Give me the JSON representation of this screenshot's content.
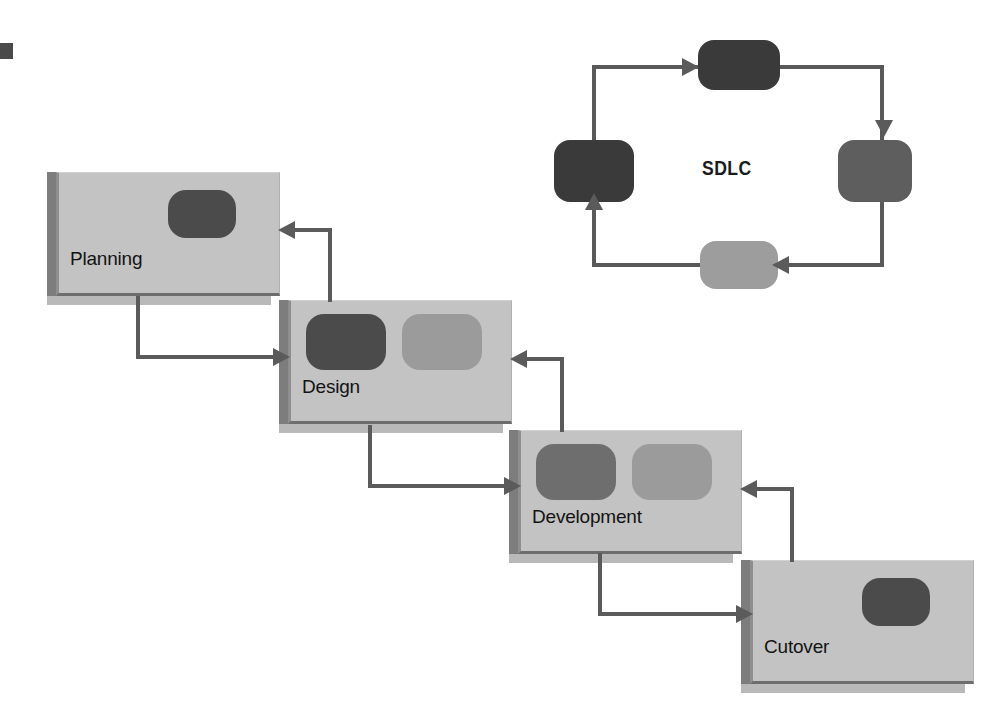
{
  "diagram": {
    "colors": {
      "box_face": "#c3c3c3",
      "box_bevel": "#7d7d7d",
      "box_shadow": "#b9b9b9",
      "connector": "#5b5b5b",
      "pill_dark": "#4b4b4b",
      "pill_mid": "#6e6e6e",
      "pill_light": "#9b9b9b",
      "text": "#131313",
      "background": "#ffffff"
    }
  },
  "waterfall": {
    "stages": [
      {
        "id": "planning",
        "label": "Planning",
        "x": 56,
        "y": 172,
        "pills": [
          {
            "tone": "dark",
            "x": 112,
            "y": 18,
            "w": 68,
            "h": 48
          }
        ]
      },
      {
        "id": "design",
        "label": "Design",
        "x": 288,
        "y": 300,
        "pills": [
          {
            "tone": "dark",
            "x": 18,
            "y": 14,
            "w": 80,
            "h": 56
          },
          {
            "tone": "light",
            "x": 114,
            "y": 14,
            "w": 80,
            "h": 56
          }
        ]
      },
      {
        "id": "development",
        "label": "Development",
        "x": 518,
        "y": 430,
        "pills": [
          {
            "tone": "mid",
            "x": 18,
            "y": 14,
            "w": 80,
            "h": 56
          },
          {
            "tone": "light",
            "x": 114,
            "y": 14,
            "w": 80,
            "h": 56
          }
        ]
      },
      {
        "id": "cutover",
        "label": "Cutover",
        "x": 750,
        "y": 560,
        "pills": [
          {
            "tone": "dark",
            "x": 112,
            "y": 18,
            "w": 68,
            "h": 48
          }
        ]
      }
    ],
    "forward_flow": [
      {
        "from": "planning",
        "to": "design"
      },
      {
        "from": "design",
        "to": "development"
      },
      {
        "from": "development",
        "to": "cutover"
      }
    ],
    "feedback_flow": [
      {
        "from": "design",
        "to": "planning"
      },
      {
        "from": "development",
        "to": "design"
      },
      {
        "from": "cutover",
        "to": "development"
      }
    ]
  },
  "cycle": {
    "title": "SDLC",
    "title_x": 702,
    "title_y": 157,
    "nodes": [
      {
        "id": "top",
        "tone": "dark",
        "x": 698,
        "y": 40,
        "w": 82,
        "h": 50
      },
      {
        "id": "right",
        "tone": "mid",
        "x": 838,
        "y": 140,
        "w": 74,
        "h": 62
      },
      {
        "id": "bottom",
        "tone": "light",
        "x": 700,
        "y": 241,
        "w": 78,
        "h": 48
      },
      {
        "id": "left",
        "tone": "dark",
        "x": 554,
        "y": 140,
        "w": 80,
        "h": 62
      }
    ],
    "direction": "clockwise",
    "edges": [
      {
        "from": "left",
        "to": "top"
      },
      {
        "from": "top",
        "to": "right"
      },
      {
        "from": "right",
        "to": "bottom"
      },
      {
        "from": "bottom",
        "to": "left"
      }
    ]
  }
}
